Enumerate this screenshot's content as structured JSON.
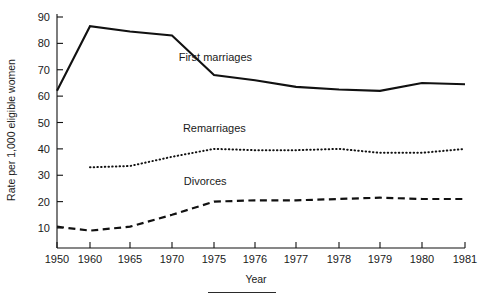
{
  "chart_data": {
    "type": "line",
    "title": "",
    "xlabel": "Year",
    "ylabel": "Rate per 1,000 eligible women",
    "x": [
      1950,
      1960,
      1965,
      1970,
      1975,
      1976,
      1977,
      1978,
      1979,
      1980,
      1981
    ],
    "xticklabels": [
      "1950",
      "1960",
      "1965",
      "1970",
      "1975",
      "1976",
      "1977",
      "1978",
      "1979",
      "1980",
      "1981"
    ],
    "yticklabels": [
      "10",
      "20",
      "30",
      "40",
      "50",
      "60",
      "70",
      "80",
      "90"
    ],
    "yticks": [
      10,
      20,
      30,
      40,
      50,
      60,
      70,
      80,
      90
    ],
    "xlim": [
      1950,
      1981
    ],
    "ylim": [
      0,
      92
    ],
    "grid": false,
    "legend": "inline-labels",
    "series": [
      {
        "name": "First marriages",
        "style": "solid",
        "label_x": 1970.8,
        "label_y": 73.5,
        "x": [
          1950,
          1960,
          1965,
          1970,
          1975,
          1976,
          1977,
          1978,
          1979,
          1980,
          1981
        ],
        "values": [
          62,
          86.5,
          84.5,
          83,
          68,
          66,
          63.5,
          62.5,
          62,
          65,
          64.5
        ]
      },
      {
        "name": "Remarriages",
        "style": "dotted",
        "label_x": 1971.3,
        "label_y": 46.5,
        "x": [
          1960,
          1965,
          1970,
          1975,
          1976,
          1977,
          1978,
          1979,
          1980,
          1981
        ],
        "values": [
          33,
          33.5,
          37,
          40,
          39.5,
          39.5,
          40,
          38.5,
          38.5,
          40
        ]
      },
      {
        "name": "Divorces",
        "style": "dashed",
        "label_x": 1971.4,
        "label_y": 26.5,
        "x": [
          1950,
          1960,
          1965,
          1970,
          1975,
          1976,
          1977,
          1978,
          1979,
          1980,
          1981
        ],
        "values": [
          10.5,
          9,
          10.5,
          15,
          20,
          20.5,
          20.5,
          21,
          21.5,
          21,
          21
        ]
      }
    ]
  }
}
